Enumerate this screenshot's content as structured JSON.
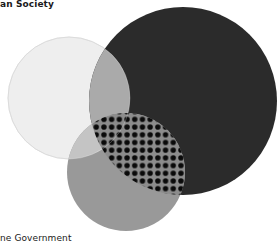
{
  "diagram": {
    "type": "venn",
    "labels": {
      "top_left": "an Society",
      "bottom_left": "ne Government"
    },
    "colors": {
      "background": "#ffffff",
      "light_circle": "#eeeeee",
      "light_circle_stroke": "#d0d0d0",
      "dark_circle": "#2b2b2b",
      "medium_circle": "#999999",
      "light_dark_overlap": "#aaaaaa",
      "light_medium_overlap": "#c4c4c4",
      "dot_background": "#8c8c8c",
      "dot_color": "#0a0a0a"
    },
    "circles": [
      {
        "name": "light",
        "cx": 69,
        "cy": 98,
        "r": 61
      },
      {
        "name": "dark",
        "cx": 183,
        "cy": 101,
        "r": 94
      },
      {
        "name": "medium",
        "cx": 126,
        "cy": 172,
        "r": 59
      }
    ]
  }
}
